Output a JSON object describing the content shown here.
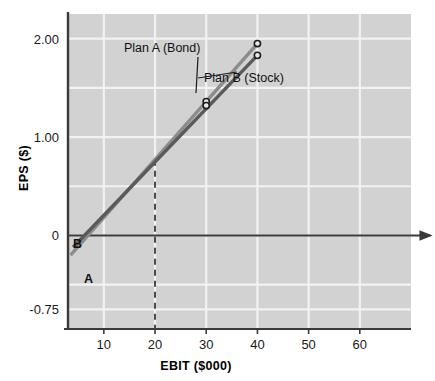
{
  "figure": {
    "background_color": "#ffffff",
    "plot_background_color": "#d2d2d2",
    "gridline_color": "#f2f2f2",
    "axis_color": "#3a3a3a"
  },
  "chart_data": {
    "type": "line",
    "title": "",
    "subtitle": "",
    "xlabel": "EBIT ($000)",
    "ylabel": "EPS ($)",
    "xlim": [
      3,
      70
    ],
    "ylim": [
      -0.95,
      2.25
    ],
    "xticks": [
      10,
      20,
      30,
      40,
      50,
      60
    ],
    "xtick_labels": [
      "10",
      "20",
      "30",
      "40",
      "50",
      "60"
    ],
    "yticks": [
      2.0,
      1.0,
      0,
      -0.75
    ],
    "ytick_labels": [
      "2.00",
      "1.00",
      "0",
      "-0.75"
    ],
    "grid": true,
    "legend_position": "inline-annotations",
    "series": [
      {
        "name": "Plan A (Bond)",
        "short_label": "A",
        "color": "#8c8c8c",
        "x": [
          3.5,
          40
        ],
        "y": [
          -0.2,
          1.95
        ],
        "x_intercept": 7.0,
        "markers": [
          {
            "x": 30,
            "y": 1.36
          },
          {
            "x": 40,
            "y": 1.95
          }
        ]
      },
      {
        "name": "Plan B (Stock)",
        "short_label": "B",
        "color": "#5a5a5a",
        "x": [
          4.0,
          40
        ],
        "y": [
          -0.12,
          1.83
        ],
        "x_intercept": 6.3,
        "markers": [
          {
            "x": 30,
            "y": 1.32
          },
          {
            "x": 40,
            "y": 1.83
          }
        ]
      }
    ],
    "crossover_point": {
      "x": 20,
      "y": 0.77,
      "label": ""
    },
    "annotations": [
      {
        "text": "Plan A (Bond)",
        "x_px": 124,
        "y_px": 52,
        "leader_to_x_px": 196,
        "leader_to_y_px": 93
      },
      {
        "text": "Plan B (Stock)",
        "x_px": 204,
        "y_px": 82,
        "leader_to_x_px": 237,
        "leader_to_y_px": 72
      },
      {
        "text": "B",
        "x_px": 73,
        "y_px": 248
      },
      {
        "text": "A",
        "x_px": 84,
        "y_px": 283
      }
    ],
    "reference_lines": [
      {
        "orientation": "vertical",
        "value": 20,
        "style": "dashed",
        "color": "#4a4a4a"
      },
      {
        "orientation": "horizontal",
        "value": 0,
        "style": "solid-arrow",
        "color": "#3a3a3a"
      }
    ]
  }
}
